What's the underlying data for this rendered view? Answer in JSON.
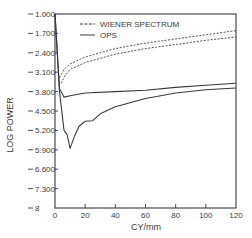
{
  "chart_data": {
    "type": "line",
    "title": "",
    "xlabel": "CY/mm",
    "ylabel": "LOG POWER",
    "xlim": [
      0,
      120
    ],
    "ylim": [
      1.0,
      8.0
    ],
    "y_inverted": true,
    "grid": false,
    "legend_position": "upper-left inside",
    "x_ticks": [
      0,
      20,
      40,
      60,
      80,
      100,
      120
    ],
    "x_tick_labels": [
      "0",
      "20",
      "40",
      "60",
      "80",
      "100",
      "120"
    ],
    "y_ticks": [
      1.0,
      1.7,
      2.4,
      3.1,
      3.8,
      4.5,
      5.2,
      5.9,
      6.6,
      7.3,
      8.0
    ],
    "y_tick_labels": [
      "1.000",
      "1.700",
      "2.400",
      "3.100",
      "3.800",
      "4.500",
      "5.200",
      "5.900",
      "6.600",
      "7.300",
      "8"
    ],
    "legend": [
      {
        "label": "WIENER SPECTRUM",
        "style": "dashed"
      },
      {
        "label": "OPS",
        "style": "solid"
      }
    ],
    "series": [
      {
        "name": "WIENER SPECTRUM (upper)",
        "style": "dashed",
        "x": [
          3,
          6,
          10,
          20,
          30,
          40,
          60,
          80,
          100,
          120
        ],
        "y": [
          3.3,
          3.0,
          2.8,
          2.55,
          2.4,
          2.25,
          2.05,
          1.9,
          1.75,
          1.6
        ]
      },
      {
        "name": "WIENER SPECTRUM (lower)",
        "style": "dashed",
        "x": [
          4,
          7,
          10,
          20,
          30,
          40,
          60,
          80,
          100,
          120
        ],
        "y": [
          3.5,
          3.2,
          3.0,
          2.75,
          2.6,
          2.45,
          2.25,
          2.1,
          1.95,
          1.83
        ]
      },
      {
        "name": "OPS (upper)",
        "style": "solid",
        "x": [
          0,
          3,
          6,
          10,
          20,
          40,
          60,
          80,
          100,
          120
        ],
        "y": [
          1.0,
          3.7,
          4.0,
          3.95,
          3.85,
          3.8,
          3.75,
          3.65,
          3.57,
          3.5
        ]
      },
      {
        "name": "OPS (lower)",
        "style": "solid",
        "x": [
          0,
          3,
          6,
          8,
          10,
          13,
          16,
          20,
          25,
          30,
          40,
          60,
          80,
          100,
          120
        ],
        "y": [
          1.0,
          3.8,
          5.2,
          5.35,
          5.85,
          5.4,
          5.05,
          4.87,
          4.85,
          4.6,
          4.35,
          4.05,
          3.85,
          3.73,
          3.67
        ]
      }
    ]
  }
}
